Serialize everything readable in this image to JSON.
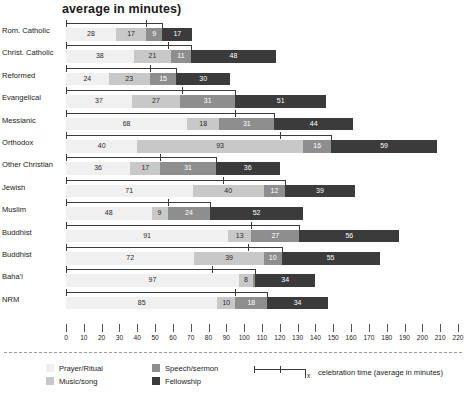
{
  "chart_data": {
    "type": "bar",
    "title": "average in minutes)",
    "xlabel": "",
    "ylabel": "",
    "xlim": [
      0,
      220
    ],
    "xticks": [
      0,
      10,
      20,
      30,
      40,
      50,
      60,
      70,
      80,
      90,
      100,
      110,
      120,
      130,
      140,
      150,
      160,
      170,
      180,
      190,
      200,
      210,
      220
    ],
    "grid": false,
    "orientation": "horizontal",
    "stacked": true,
    "legend_position": "bottom",
    "categories": [
      "Rom. Catholic",
      "Christ. Catholic",
      "Reformed",
      "Evangelical",
      "Messianic",
      "Orthodox",
      "Other Christian",
      "Jewish",
      "Muslim",
      "Buddhist",
      "Buddhist",
      "Baha'i",
      "NRM"
    ],
    "series": [
      {
        "name": "Prayer/Ritual",
        "color": "#f0f0f0",
        "values": [
          28,
          38,
          24,
          37,
          68,
          40,
          36,
          71,
          48,
          91,
          72,
          97,
          85
        ]
      },
      {
        "name": "Music/song",
        "color": "#c8c8c8",
        "values": [
          17,
          21,
          23,
          27,
          18,
          93,
          17,
          40,
          9,
          13,
          39,
          8,
          10
        ]
      },
      {
        "name": "Speech/sermon",
        "color": "#8e8e8e",
        "values": [
          9,
          11,
          15,
          31,
          31,
          16,
          31,
          12,
          24,
          27,
          10,
          1,
          18
        ]
      },
      {
        "name": "Fellowship",
        "color": "#3b3b3b",
        "values": [
          17,
          48,
          30,
          51,
          44,
          59,
          36,
          39,
          52,
          56,
          55,
          34,
          34
        ]
      }
    ],
    "celebration_time": [
      54,
      70,
      62,
      95,
      117,
      149,
      84,
      123,
      81,
      131,
      121,
      106,
      113
    ],
    "celebration_mid": [
      45,
      57,
      47,
      65,
      95,
      120,
      53,
      88,
      57,
      104,
      102,
      82,
      95
    ],
    "annotations": [
      "celebration time (average in minutes)"
    ]
  },
  "legend": {
    "items": [
      {
        "label": "Prayer/Ritual",
        "color": "#f0f0f0"
      },
      {
        "label": "Music/song",
        "color": "#c8c8c8"
      },
      {
        "label": "Speech/sermon",
        "color": "#8e8e8e"
      },
      {
        "label": "Fellowship",
        "color": "#3b3b3b"
      }
    ],
    "bracket_marker": "x",
    "note": "celebration time (average in minutes)"
  }
}
